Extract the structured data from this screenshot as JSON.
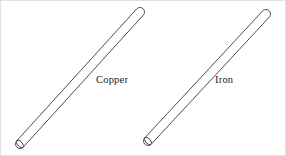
{
  "figure": {
    "background_color": "#ffffff",
    "border_color": "#e2e2e2",
    "stroke_color": "#3a3a3a",
    "label_color": "#1b1b1b",
    "width": 286,
    "height": 156
  },
  "rods": [
    {
      "id": "copper-rod",
      "label": "Copper",
      "label_x": 95,
      "label_y": 82,
      "material": "copper",
      "orientation": "diagonal-up-right",
      "top_end": "rounded-cap",
      "bottom_end": "open-ellipse",
      "axis": {
        "x1": 19,
        "y1": 143,
        "x2": 139,
        "y2": 11
      },
      "radius": 4.5,
      "ellipse_rx": 2.4,
      "ellipse_ry": 4.6,
      "ellipse_rotation": -42
    },
    {
      "id": "iron-rod",
      "label": "Iron",
      "label_x": 214,
      "label_y": 82,
      "material": "iron",
      "orientation": "diagonal-up-right",
      "top_end": "rounded-cap",
      "bottom_end": "open-ellipse",
      "axis": {
        "x1": 147,
        "y1": 140,
        "x2": 265,
        "y2": 13
      },
      "radius": 4.5,
      "ellipse_rx": 2.4,
      "ellipse_ry": 4.6,
      "ellipse_rotation": -42
    }
  ]
}
